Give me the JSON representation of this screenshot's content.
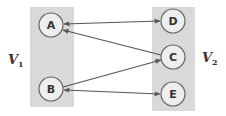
{
  "diagram": {
    "type": "bipartite-graph",
    "colors": {
      "background": "#ffffff",
      "panel": "#d9d9d9",
      "node_fill": "#eeeeee",
      "node_stroke": "#666666",
      "edge": "#555555",
      "text": "#333333"
    },
    "sets": [
      {
        "id": "V1",
        "label": "V",
        "subscript": "1",
        "nodes": [
          "A",
          "B"
        ]
      },
      {
        "id": "V2",
        "label": "V",
        "subscript": "2",
        "nodes": [
          "D",
          "C",
          "E"
        ]
      }
    ],
    "nodes": [
      {
        "id": "A",
        "label": "A",
        "set": "V1"
      },
      {
        "id": "B",
        "label": "B",
        "set": "V1"
      },
      {
        "id": "D",
        "label": "D",
        "set": "V2"
      },
      {
        "id": "C",
        "label": "C",
        "set": "V2"
      },
      {
        "id": "E",
        "label": "E",
        "set": "V2"
      }
    ],
    "edges": [
      {
        "from": "A",
        "to": "D",
        "direction": "both"
      },
      {
        "from": "C",
        "to": "A",
        "direction": "forward"
      },
      {
        "from": "B",
        "to": "C",
        "direction": "forward"
      },
      {
        "from": "B",
        "to": "E",
        "direction": "both"
      }
    ]
  }
}
